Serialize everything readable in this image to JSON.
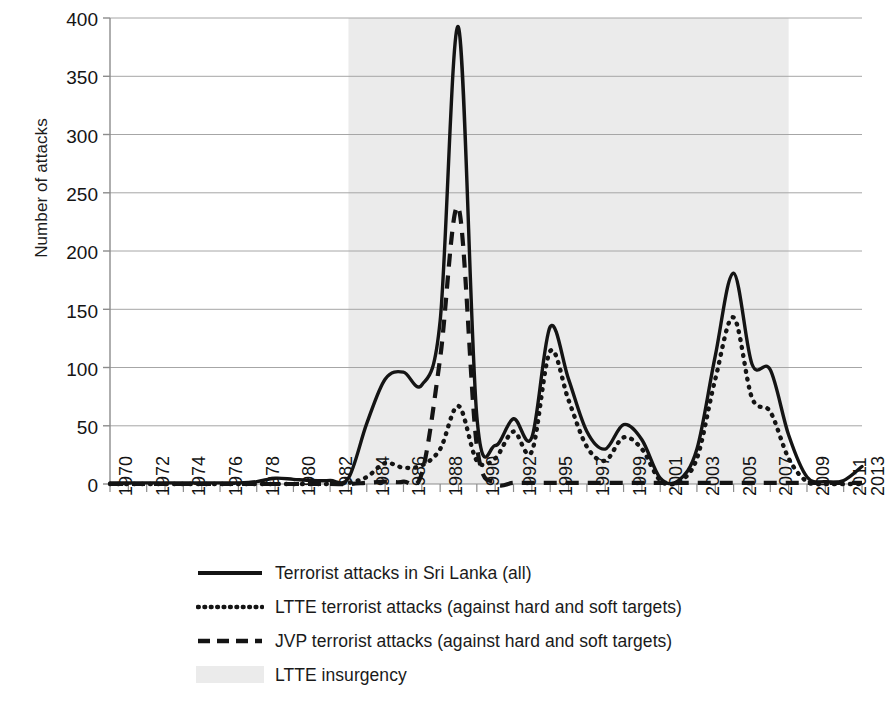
{
  "chart_data": {
    "type": "line",
    "title": "",
    "xlabel": "",
    "ylabel": "Number of attacks",
    "ylim": [
      0,
      400
    ],
    "yticks": [
      0,
      50,
      100,
      150,
      200,
      250,
      300,
      350,
      400
    ],
    "grid": true,
    "legend_position": "bottom",
    "x": [
      1970,
      1971,
      1972,
      1973,
      1974,
      1975,
      1976,
      1977,
      1978,
      1979,
      1980,
      1981,
      1982,
      1983,
      1984,
      1985,
      1986,
      1987,
      1988,
      1989,
      1990,
      1991,
      1992,
      1995,
      1996,
      1997,
      1998,
      1999,
      2000,
      2001,
      2002,
      2003,
      2004,
      2005,
      2006,
      2007,
      2008,
      2009,
      2010,
      2011,
      2012,
      2013
    ],
    "xtick_labels": [
      "1970",
      "1972",
      "1974",
      "1976",
      "1978",
      "1980",
      "1982",
      "1984",
      "1986",
      "1988",
      "1990",
      "1992",
      "1995",
      "1997",
      "1999",
      "2001",
      "2003",
      "2005",
      "2007",
      "2009",
      "2011",
      "2013"
    ],
    "series": [
      {
        "name": "Terrorist attacks in Sri Lanka (all)",
        "style": "solid",
        "color": "#141414",
        "values": [
          1,
          1,
          1,
          1,
          1,
          1,
          1,
          1,
          2,
          5,
          4,
          3,
          3,
          5,
          52,
          90,
          96,
          85,
          140,
          392,
          58,
          33,
          56,
          40,
          135,
          90,
          45,
          30,
          51,
          38,
          5,
          3,
          30,
          110,
          181,
          103,
          98,
          42,
          6,
          2,
          3,
          15
        ]
      },
      {
        "name": "LTTE terrorist attacks (against hard and soft targets)",
        "style": "dotted",
        "color": "#141414",
        "values": [
          0,
          0,
          0,
          0,
          0,
          0,
          0,
          0,
          0,
          0,
          0,
          0,
          0,
          1,
          6,
          18,
          14,
          16,
          30,
          67,
          20,
          22,
          45,
          28,
          114,
          72,
          32,
          20,
          40,
          30,
          3,
          2,
          22,
          90,
          143,
          74,
          62,
          22,
          2,
          0,
          0,
          0
        ]
      },
      {
        "name": "JVP terrorist attacks (against hard and soft targets)",
        "style": "dashed",
        "color": "#141414",
        "values": [
          0,
          0,
          0,
          0,
          0,
          0,
          0,
          0,
          0,
          0,
          0,
          0,
          0,
          0,
          1,
          2,
          2,
          9,
          108,
          237,
          33,
          1,
          1,
          1,
          1,
          1,
          1,
          1,
          1,
          1,
          1,
          1,
          1,
          1,
          1,
          1,
          1,
          1,
          1,
          1,
          1,
          1
        ]
      }
    ],
    "shaded_regions": [
      {
        "name": "LTTE insurgency",
        "x_start": 1983,
        "x_end": 2009,
        "color": "#ebebeb"
      }
    ],
    "peak_annotations": {
      "max_all": 392,
      "max_all_year": 1989,
      "max_jvp": 237,
      "max_jvp_year": 1989,
      "max_ltte": 143,
      "max_ltte_year": 2006
    }
  },
  "legend": {
    "items": [
      {
        "label": "Terrorist attacks in Sri Lanka (all)",
        "swatch": "solid-line-swatch"
      },
      {
        "label": "LTTE terrorist attacks (against hard and soft targets)",
        "swatch": "dotted-line-swatch"
      },
      {
        "label": "JVP terrorist attacks (against hard and soft targets)",
        "swatch": "dashed-line-swatch"
      },
      {
        "label": "LTTE insurgency",
        "swatch": "shaded-area-swatch"
      }
    ]
  }
}
